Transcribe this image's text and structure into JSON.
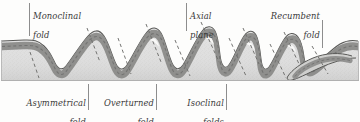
{
  "figure": {
    "kind": "geologic-cross-section-block-diagram",
    "background_color": "#fdfdfc",
    "rock_body_color": "#dcdcda",
    "marker_bed_color": "#8a8a88",
    "outline_color": "#555553",
    "axial_line_color": "#6e6e6c",
    "label_color": "#3a3a3a",
    "leader_color": "#8d8d8d"
  },
  "labels": {
    "top": [
      {
        "id": "monoclinal",
        "line1": "Monoclinal",
        "line2": "fold",
        "align": "left"
      },
      {
        "id": "axial_plane",
        "line1": "Axial",
        "line2": "plane",
        "align": "left"
      },
      {
        "id": "recumbent",
        "line1": "Recumbent",
        "line2": "fold",
        "align": "right"
      }
    ],
    "bottom": [
      {
        "id": "asymmetrical",
        "line1": "Asymmetrical",
        "line2": "fold",
        "align": "right"
      },
      {
        "id": "overturned",
        "line1": "Overturned",
        "line2": "fold",
        "align": "right"
      },
      {
        "id": "isoclinal",
        "line1": "Isoclinal",
        "line2": "folds",
        "align": "right"
      }
    ]
  },
  "fold_sequence": [
    "monoclinal fold",
    "asymmetrical fold",
    "overturned fold",
    "isoclinal folds",
    "recumbent fold"
  ]
}
